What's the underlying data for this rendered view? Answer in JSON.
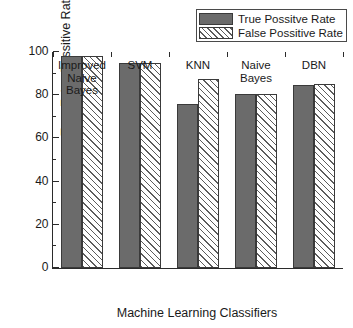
{
  "chart_data": {
    "type": "bar",
    "title": "",
    "xlabel": "Machine Learning Classifiers",
    "ylabel": "True False Possitive Rate %",
    "categories": [
      "Improved Naive Bayes",
      "SVM",
      "KNN",
      "Naive Bayes",
      "DBN"
    ],
    "category_lines": [
      [
        "Improved",
        "Naive",
        "Bayes"
      ],
      [
        "SVM"
      ],
      [
        "KNN"
      ],
      [
        "Naive",
        "Bayes"
      ],
      [
        "DBN"
      ]
    ],
    "series": [
      {
        "name": "True Possitve Rate",
        "values": [
          98,
          95,
          76,
          80.5,
          84.5
        ],
        "fill": "solid",
        "color": "#6b6b6b"
      },
      {
        "name": "False Possitive Rate",
        "values": [
          98,
          95,
          87.5,
          80.5,
          85
        ],
        "fill": "diagonal-hatch",
        "color": "#ffffff"
      }
    ],
    "ylim": [
      0,
      100
    ],
    "y_ticks": [
      0,
      20,
      40,
      60,
      80,
      100
    ],
    "y_tick_labels": [
      "0",
      "20",
      "40",
      "60",
      "80",
      "100"
    ],
    "y_minor_ticks": [
      10,
      30,
      50,
      70,
      90
    ],
    "grid": false,
    "legend_position": "top-right"
  },
  "legend": {
    "entries": [
      {
        "label": "True Possitve Rate"
      },
      {
        "label": "False Possitive Rate"
      }
    ]
  },
  "axes": {
    "y_title": "True False Possitive Rate %",
    "x_title": "Machine Learning Classifiers"
  }
}
